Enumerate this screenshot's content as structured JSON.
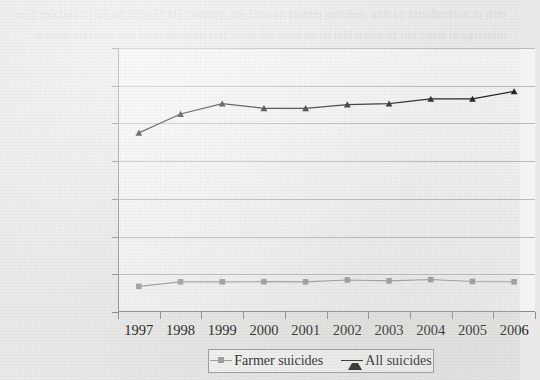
{
  "chart_data": {
    "type": "line",
    "title": "",
    "subtitle": "",
    "xlabel": "",
    "ylabel": "",
    "categories": [
      "1997",
      "1998",
      "1999",
      "2000",
      "2001",
      "2002",
      "2003",
      "2004",
      "2005",
      "2006"
    ],
    "ylim": [
      0,
      140000
    ],
    "ytick_step": 20000,
    "yticks": [
      "0",
      "20000",
      "40000",
      "60000",
      "80000",
      "100000",
      "120000",
      "140000"
    ],
    "ytick_values": [
      0,
      20000,
      40000,
      60000,
      80000,
      100000,
      120000,
      140000
    ],
    "grid": "horizontal",
    "legend_position": "bottom-center",
    "series": [
      {
        "name": "Farmer suicides",
        "color": "#9a9a96",
        "marker": "square",
        "values": [
          13600,
          16000,
          16000,
          16100,
          16000,
          17000,
          16500,
          17200,
          16200,
          16000
        ]
      },
      {
        "name": "All suicides",
        "color": "#1c1c1c",
        "marker": "triangle",
        "values": [
          95000,
          105000,
          110500,
          108000,
          108000,
          110000,
          110500,
          113000,
          113000,
          117000
        ]
      }
    ]
  },
  "legend": {
    "entries": [
      {
        "label": "Farmer suicides",
        "color": "#9a9a96",
        "marker": "square"
      },
      {
        "label": "All suicides",
        "color": "#1c1c1c",
        "marker": "triangle"
      }
    ]
  },
  "page": {
    "bleed_text": "etrtr ot noitcudortni na dna ,sedicius remraf no atad eht ,yrtnuoc eht ni sedicius lla ot noitaler ni erutlucirga ni sisirc eht fo noitacidni na sa neeb sah ereht taht detartsnomed sah hcraeser tneceR ."
  }
}
